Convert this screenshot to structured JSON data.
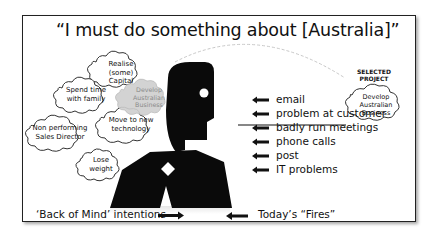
{
  "title": "“I must do something about [Australia]”",
  "back_of_mind_clouds": [
    {
      "label": "Realise (some) Capital",
      "lines": [
        "Realise",
        "(some) Capital"
      ]
    },
    {
      "label": "Spend time with family",
      "lines": [
        "Spend time",
        "with family"
      ]
    },
    {
      "label": "Develop Australian Business",
      "lines": [
        "Develop",
        "Australian",
        "Business"
      ],
      "faded": true
    },
    {
      "label": "Non performing Sales Director",
      "lines": [
        "Non performing",
        "Sales Director"
      ]
    },
    {
      "label": "Move to new technology",
      "lines": [
        "Move to new",
        "technology"
      ]
    },
    {
      "label": "Lose weight",
      "lines": [
        "Lose",
        "weight"
      ]
    }
  ],
  "todays_fires": [
    {
      "label": "email"
    },
    {
      "label": "problem at customer"
    },
    {
      "label": "badly run meetings",
      "underlined": true
    },
    {
      "label": "phone calls"
    },
    {
      "label": "post"
    },
    {
      "label": "IT problems"
    }
  ],
  "selected_project": {
    "heading": "SELECTED PROJECT",
    "heading_lines": [
      "SELECTED",
      "PROJECT"
    ],
    "cloud_lines": [
      "Develop",
      "Australian",
      "Business"
    ]
  },
  "captions": {
    "back_of_mind": "‘Back of Mind’ intentions",
    "todays_fires": "Today’s “Fires”"
  },
  "icons": {
    "figure": "person-silhouette-icon",
    "arrow": "arrow-left-icon"
  },
  "colors": {
    "frame": "#222222",
    "silhouette": "#0a0a0a",
    "faded_cloud": "#cfcfcf",
    "ground_shadow": "#d8d8d8"
  }
}
